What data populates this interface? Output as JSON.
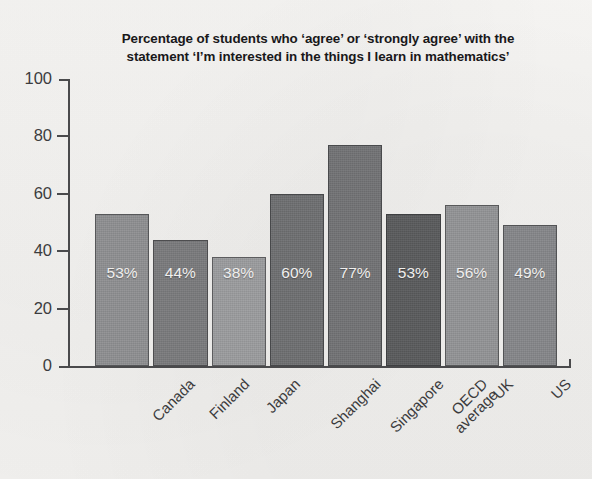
{
  "chart_data": {
    "type": "bar",
    "title": "Percentage of students who ‘agree’ or ‘strongly agree’ with the statement ‘I’m interested in the things I learn in mathematics’",
    "title_lines": [
      "Percentage of students who ‘agree’ or ‘strongly agree’ with the",
      "statement ‘I’m interested in the things I learn in mathematics’"
    ],
    "xlabel": "",
    "ylabel": "",
    "ylim": [
      0,
      100
    ],
    "yticks": [
      0,
      20,
      40,
      60,
      80,
      100
    ],
    "grid": false,
    "legend": "none",
    "categories": [
      "Canada",
      "Finland",
      "Japan",
      "Shanghai",
      "Singapore",
      "OECD average",
      "UK",
      "US"
    ],
    "category_lines": [
      [
        "Canada"
      ],
      [
        "Finland"
      ],
      [
        "Japan"
      ],
      [
        "Shanghai"
      ],
      [
        "Singapore"
      ],
      [
        "OECD",
        "average"
      ],
      [
        "UK"
      ],
      [
        "US"
      ]
    ],
    "values": [
      53,
      44,
      38,
      60,
      77,
      53,
      56,
      49
    ],
    "bar_labels": [
      "53%",
      "44%",
      "38%",
      "60%",
      "77%",
      "53%",
      "56%",
      "49%"
    ],
    "bar_colors": [
      "#8f9092",
      "#7a7b7d",
      "#9b9c9e",
      "#6e6f71",
      "#727375",
      "#5a5b5d",
      "#939496",
      "#86878a"
    ],
    "value_label_color": "#f0efee",
    "axis_color": "#4a4a4c",
    "background_color": "#f4f3f1",
    "title_color": "#19181a"
  }
}
